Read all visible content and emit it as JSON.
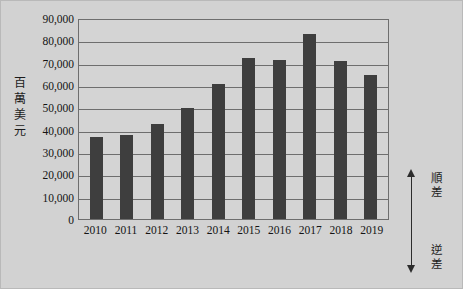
{
  "chart_data": {
    "type": "bar",
    "title": "",
    "subtitle": "",
    "xlabel": "",
    "ylabel": "百萬美元",
    "ylim": [
      0,
      90000
    ],
    "yticks": [
      "90,000",
      "80,000",
      "70,000",
      "60,000",
      "50,000",
      "40,000",
      "30,000",
      "20,000",
      "10,000",
      "0"
    ],
    "ytick_values": [
      90000,
      80000,
      70000,
      60000,
      50000,
      40000,
      30000,
      20000,
      10000,
      0
    ],
    "grid": true,
    "legend_position": "right",
    "categories": [
      "2010",
      "2011",
      "2012",
      "2013",
      "2014",
      "2015",
      "2016",
      "2017",
      "2018",
      "2019"
    ],
    "values": [
      36500,
      37700,
      42600,
      49800,
      60400,
      72000,
      71200,
      82800,
      70600,
      64500
    ],
    "series": [
      {
        "name": "貿易差額",
        "values": [
          36500,
          37700,
          42600,
          49800,
          60400,
          72000,
          71200,
          82800,
          70600,
          64500
        ]
      }
    ],
    "annotations": [
      {
        "label": "順差",
        "direction": "up"
      },
      {
        "label": "逆差",
        "direction": "down"
      }
    ],
    "colors": {
      "bar": "#3e3e3e",
      "plot_background": "#d4d4d4",
      "figure_background": "#d2d2d2",
      "axis": "#6e6e6e",
      "text": "#141414"
    }
  },
  "axis": {
    "y_title_chars": [
      "百",
      "萬",
      "美",
      "元"
    ]
  },
  "annotation": {
    "surplus_chars": [
      "順",
      "差"
    ],
    "deficit_chars": [
      "逆",
      "差"
    ],
    "up_arrow_icon": "arrow-up-icon",
    "down_arrow_icon": "arrow-down-icon"
  }
}
